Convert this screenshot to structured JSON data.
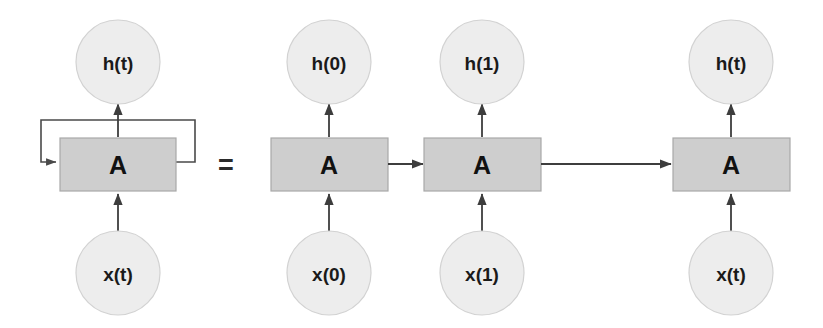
{
  "figure": {
    "name": "rnn-unrolled-diagram",
    "equals_symbol": "=",
    "colors": {
      "circle_fill": "#ededed",
      "circle_stroke": "#d2d2d2",
      "box_fill": "#cecece",
      "box_stroke": "#a9a9a9",
      "arrow": "#3d3d3d",
      "text": "#111111",
      "background": "#ffffff"
    }
  },
  "folded": {
    "output_label": "h(t)",
    "cell_label": "A",
    "input_label": "x(t)"
  },
  "unrolled": {
    "steps": [
      {
        "output_label": "h(0)",
        "cell_label": "A",
        "input_label": "x(0)"
      },
      {
        "output_label": "h(1)",
        "cell_label": "A",
        "input_label": "x(1)"
      },
      {
        "output_label": "h(t)",
        "cell_label": "A",
        "input_label": "x(t)"
      }
    ]
  }
}
